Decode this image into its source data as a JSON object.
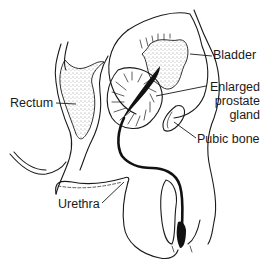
{
  "figure": {
    "style": "black-and-white line illustration"
  },
  "labels": {
    "rectum": "Rectum",
    "bladder": "Bladder",
    "prostate_line1": "Enlarged",
    "prostate_line2": "prostate",
    "prostate_line3": "gland",
    "pubic_bone": "Pubic bone",
    "urethra": "Urethra"
  },
  "colors": {
    "ink": "#1a1a1a",
    "background": "#ffffff"
  }
}
